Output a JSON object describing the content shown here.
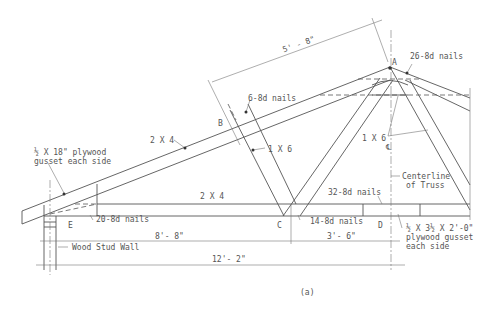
{
  "figure": {
    "caption": "(a)"
  },
  "labels": {
    "gusset_left": "½ X 18\" plywood",
    "gusset_left_2": "gusset each side",
    "top_chord": "2 X 4",
    "bottom_chord": "2 X 4",
    "web_left": "1 X 6",
    "web_right": "1 X 6",
    "nails_b": "6-8d nails",
    "nails_a": "26-8d nails",
    "nails_e": "20-8d nails",
    "nails_c": "14-8d nails",
    "nails_d": "32-8d nails",
    "centerline_symbol": "℄",
    "centerline_1": "Centerline",
    "centerline_2": "of Truss",
    "gusset_d_1": "½ X 3½ X 2'-0\"",
    "gusset_d_2": "plywood gusset",
    "gusset_d_3": "each side",
    "wall": "Wood Stud Wall",
    "point_a": "A",
    "point_b": "B",
    "point_c": "C",
    "point_d": "D",
    "point_e": "E"
  },
  "dimensions": {
    "top_chord_segment": "5' - 8\"",
    "e_to_c": "8'- 8\"",
    "c_to_d": "3'- 6\"",
    "half_span": "12'- 2\""
  }
}
